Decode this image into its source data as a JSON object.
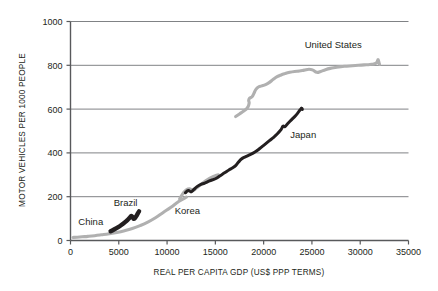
{
  "chart_data": {
    "type": "line",
    "title": "",
    "xlabel": "REAL PER CAPITA GDP (US$  PPP TERMS)",
    "ylabel": "MOTOR VEHICLES PER 1000 PEOPLE",
    "xlim": [
      0,
      35000
    ],
    "ylim": [
      0,
      1000
    ],
    "xticks": [
      0,
      5000,
      10000,
      15000,
      20000,
      25000,
      30000,
      35000
    ],
    "yticks": [
      0,
      200,
      400,
      600,
      800,
      1000
    ],
    "xtick_labels": [
      "0",
      "5000",
      "10000",
      "15000",
      "20000",
      "25000",
      "30000",
      "35000"
    ],
    "ytick_labels": [
      "0",
      "200",
      "400",
      "600",
      "800",
      "1000"
    ],
    "grid": "horizontal",
    "legend": "inline-labels",
    "colors": {
      "dark": "#231f20",
      "light": "#b0b0b0",
      "axis": "#58595b",
      "grid": "#808285",
      "background": "#ffffff"
    },
    "series": [
      {
        "name": "China",
        "label": "China",
        "color": "#b0b0b0",
        "style": "light-thick",
        "label_x": 2100,
        "label_y": 72,
        "points": [
          [
            250,
            14
          ],
          [
            700,
            15
          ],
          [
            1200,
            17
          ],
          [
            1800,
            19
          ],
          [
            2500,
            22
          ],
          [
            3200,
            26
          ],
          [
            4000,
            31
          ],
          [
            4800,
            37
          ],
          [
            5600,
            45
          ],
          [
            6400,
            55
          ],
          [
            7200,
            68
          ],
          [
            8000,
            84
          ],
          [
            8800,
            104
          ],
          [
            9600,
            128
          ],
          [
            10400,
            152
          ],
          [
            11200,
            178
          ],
          [
            12000,
            198
          ]
        ]
      },
      {
        "name": "Brazil",
        "label": "Brazil",
        "color": "#231f20",
        "style": "dark-blob",
        "label_x": 5700,
        "label_y": 158,
        "points": [
          [
            4150,
            42
          ],
          [
            4500,
            50
          ],
          [
            4900,
            60
          ],
          [
            5300,
            72
          ],
          [
            5650,
            84
          ],
          [
            5950,
            96
          ],
          [
            6150,
            105
          ],
          [
            6300,
            112
          ],
          [
            6450,
            106
          ],
          [
            6550,
            99
          ],
          [
            6700,
            104
          ],
          [
            6850,
            114
          ],
          [
            7000,
            126
          ],
          [
            7100,
            133
          ]
        ]
      },
      {
        "name": "Korea",
        "label": "Korea",
        "color": "#b0b0b0",
        "style": "light-thick",
        "label_x": 12100,
        "label_y": 122,
        "points": [
          [
            11300,
            190
          ],
          [
            11700,
            218
          ],
          [
            12000,
            232
          ],
          [
            12350,
            236
          ],
          [
            12700,
            228
          ],
          [
            13000,
            238
          ],
          [
            13400,
            252
          ],
          [
            13800,
            266
          ],
          [
            14200,
            278
          ],
          [
            14600,
            288
          ],
          [
            15000,
            296
          ],
          [
            15300,
            300
          ]
        ]
      },
      {
        "name": "Japan",
        "label": "Japan",
        "color": "#231f20",
        "style": "dark-thick",
        "label_x": 24100,
        "label_y": 470,
        "points": [
          [
            11900,
            218
          ],
          [
            12200,
            228
          ],
          [
            12500,
            222
          ],
          [
            12750,
            232
          ],
          [
            13100,
            246
          ],
          [
            13500,
            256
          ],
          [
            13900,
            262
          ],
          [
            14400,
            272
          ],
          [
            15000,
            282
          ],
          [
            15500,
            296
          ],
          [
            16000,
            310
          ],
          [
            16400,
            322
          ],
          [
            16800,
            332
          ],
          [
            17100,
            342
          ],
          [
            17400,
            358
          ],
          [
            17700,
            372
          ],
          [
            18100,
            382
          ],
          [
            18600,
            392
          ],
          [
            19100,
            404
          ],
          [
            19600,
            420
          ],
          [
            20100,
            438
          ],
          [
            20600,
            456
          ],
          [
            21000,
            470
          ],
          [
            21400,
            486
          ],
          [
            21800,
            506
          ],
          [
            22000,
            522
          ],
          [
            22200,
            520
          ],
          [
            22500,
            534
          ],
          [
            22900,
            552
          ],
          [
            23300,
            570
          ],
          [
            23600,
            586
          ],
          [
            23800,
            598
          ],
          [
            23950,
            604
          ],
          [
            24000,
            598
          ],
          [
            23900,
            604
          ]
        ]
      },
      {
        "name": "United States",
        "label": "United States",
        "color": "#b0b0b0",
        "style": "light-thick",
        "label_x": 27200,
        "label_y": 880,
        "points": [
          [
            17100,
            566
          ],
          [
            17500,
            578
          ],
          [
            17900,
            590
          ],
          [
            18200,
            600
          ],
          [
            18400,
            612
          ],
          [
            18500,
            628
          ],
          [
            18450,
            640
          ],
          [
            18550,
            650
          ],
          [
            18800,
            656
          ],
          [
            19000,
            672
          ],
          [
            19200,
            690
          ],
          [
            19500,
            702
          ],
          [
            19800,
            706
          ],
          [
            20200,
            712
          ],
          [
            20600,
            722
          ],
          [
            21000,
            736
          ],
          [
            21400,
            748
          ],
          [
            21800,
            756
          ],
          [
            22200,
            762
          ],
          [
            22700,
            768
          ],
          [
            23200,
            772
          ],
          [
            23700,
            774
          ],
          [
            24200,
            778
          ],
          [
            24700,
            782
          ],
          [
            25100,
            778
          ],
          [
            25500,
            768
          ],
          [
            25900,
            772
          ],
          [
            26400,
            780
          ],
          [
            26900,
            786
          ],
          [
            27400,
            790
          ],
          [
            28000,
            794
          ],
          [
            28600,
            796
          ],
          [
            29200,
            798
          ],
          [
            29800,
            800
          ],
          [
            30400,
            802
          ],
          [
            31000,
            804
          ],
          [
            31400,
            806
          ],
          [
            31700,
            812
          ],
          [
            31850,
            826
          ],
          [
            31950,
            812
          ],
          [
            32000,
            804
          ]
        ]
      }
    ]
  }
}
